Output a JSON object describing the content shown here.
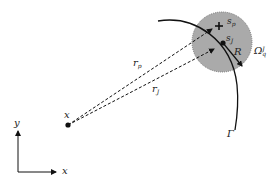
{
  "diagram": {
    "colors": {
      "circle_fill": "#aaaaaa",
      "circle_border": "#777777",
      "stroke": "#111111"
    },
    "labels": {
      "origin_point": "x",
      "axis_y": "y",
      "axis_x": "x",
      "r_p_main": "r",
      "r_p_sub": "p",
      "r_J_main": "r",
      "r_J_sub": "J",
      "s_p_main": "s",
      "s_p_sub": "p",
      "s_J_main": "s",
      "s_J_sub": "J",
      "radius": "R",
      "omega_main": "Ω",
      "omega_sup": "J",
      "omega_sub": "q",
      "gamma": "Γ"
    }
  }
}
